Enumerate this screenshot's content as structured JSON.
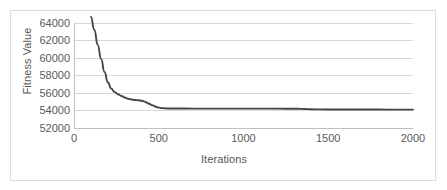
{
  "chart_data": {
    "type": "line",
    "title": "",
    "xlabel": "Iterations",
    "ylabel": "Fitness Value",
    "xlim": [
      0,
      2000
    ],
    "ylim": [
      52000,
      64000
    ],
    "xticks": [
      "0",
      "500",
      "1000",
      "1500",
      "2000"
    ],
    "xtick_values": [
      0,
      500,
      1000,
      1500,
      2000
    ],
    "yticks": [
      "52000",
      "54000",
      "56000",
      "58000",
      "60000",
      "62000",
      "64000"
    ],
    "ytick_values": [
      52000,
      54000,
      56000,
      58000,
      60000,
      62000,
      64000
    ],
    "grid": "horizontal",
    "legend": "none",
    "line_color": "#454545",
    "grid_color": "#d9d9d9",
    "axis_color": "#bfbfbf",
    "text_color": "#5a5a5a",
    "background": "#ffffff",
    "border_color": "#dcdcdc",
    "series": [
      {
        "name": "Fitness Value",
        "color": "#454545",
        "x": [
          100,
          120,
          140,
          160,
          180,
          200,
          220,
          240,
          260,
          280,
          300,
          320,
          340,
          360,
          380,
          400,
          420,
          440,
          460,
          480,
          500,
          520,
          540,
          560,
          600,
          700,
          800,
          900,
          1000,
          1100,
          1200,
          1300,
          1340,
          1380,
          1420,
          1500,
          1600,
          1700,
          1800,
          1900,
          2000
        ],
        "y": [
          64700,
          63200,
          61500,
          59900,
          58400,
          57200,
          56500,
          56100,
          55850,
          55650,
          55480,
          55340,
          55250,
          55200,
          55170,
          55120,
          54980,
          54800,
          54620,
          54450,
          54330,
          54270,
          54240,
          54230,
          54225,
          54220,
          54218,
          54216,
          54214,
          54212,
          54210,
          54205,
          54190,
          54160,
          54130,
          54115,
          54110,
          54108,
          54106,
          54105,
          54104
        ]
      }
    ]
  },
  "axes": {
    "y_title": "Fitness Value",
    "x_title": "Iterations"
  }
}
